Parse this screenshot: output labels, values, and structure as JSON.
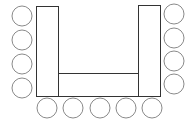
{
  "diagram": {
    "type": "u-shape-seating-layout",
    "colors": {
      "table_stroke": "#333333",
      "seat_stroke": "#8a8a8a",
      "fill": "#ffffff"
    },
    "tables": [
      {
        "id": "left-table",
        "x": 36,
        "y": 6,
        "w": 22,
        "h": 90
      },
      {
        "id": "center-table",
        "x": 58,
        "y": 73,
        "w": 80,
        "h": 23
      },
      {
        "id": "right-table",
        "x": 138,
        "y": 5,
        "w": 22,
        "h": 91
      }
    ],
    "seats": {
      "radius": 10,
      "left": [
        {
          "cx": 22,
          "cy": 16
        },
        {
          "cx": 22,
          "cy": 40
        },
        {
          "cx": 22,
          "cy": 64
        },
        {
          "cx": 22,
          "cy": 88
        }
      ],
      "right": [
        {
          "cx": 174,
          "cy": 14
        },
        {
          "cx": 174,
          "cy": 38
        },
        {
          "cx": 174,
          "cy": 61
        },
        {
          "cx": 174,
          "cy": 84
        }
      ],
      "bottom": [
        {
          "cx": 47,
          "cy": 108
        },
        {
          "cx": 73,
          "cy": 108
        },
        {
          "cx": 100,
          "cy": 108
        },
        {
          "cx": 126,
          "cy": 108
        },
        {
          "cx": 152,
          "cy": 108
        }
      ]
    },
    "seat_count": 13
  }
}
